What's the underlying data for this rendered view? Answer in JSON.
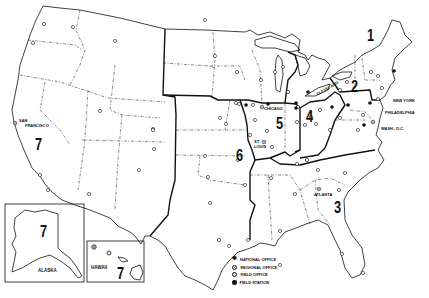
{
  "header": {
    "text": "· · ·  ·  · ·"
  },
  "map": {
    "title": "Regional map of the United States",
    "regions": [
      {
        "number": "1",
        "x": 366,
        "y": 36
      },
      {
        "number": "2",
        "x": 353,
        "y": 86
      },
      {
        "number": "3",
        "x": 333,
        "y": 208
      },
      {
        "number": "4",
        "x": 307,
        "y": 105
      },
      {
        "number": "5",
        "x": 275,
        "y": 100
      },
      {
        "number": "6",
        "x": 248,
        "y": 158
      },
      {
        "number": "7",
        "x": 36,
        "y": 168
      }
    ],
    "cities": [
      {
        "name": "NEW YORK",
        "x": 369,
        "y": 100
      },
      {
        "name": "PHILADELPHIA",
        "x": 371,
        "y": 111
      },
      {
        "name": "WASH., D.C.",
        "x": 382,
        "y": 127
      },
      {
        "name": "CLEVELAND",
        "x": 320,
        "y": 94
      },
      {
        "name": "CHICAGO",
        "x": 262,
        "y": 107
      },
      {
        "name": "ST.",
        "x": 254,
        "y": 141
      },
      {
        "name": "LOUIS",
        "x": 254,
        "y": 145
      },
      {
        "name": "ATLANTA",
        "x": 315,
        "y": 194
      },
      {
        "name": "SAN",
        "x": 20,
        "y": 121
      },
      {
        "name": "FRANCISCO",
        "x": 25,
        "y": 125
      }
    ],
    "insets": {
      "alaska": {
        "label": "ALASKA",
        "region": "7"
      },
      "hawaii": {
        "label": "HAWAII",
        "region": "7"
      }
    }
  },
  "legend": {
    "items": [
      {
        "symbol": "national",
        "label": "NATIONAL OFFICE"
      },
      {
        "symbol": "regional",
        "label": "REGIONAL OFFICE"
      },
      {
        "symbol": "field",
        "label": "FIELD OFFICE"
      },
      {
        "symbol": "station",
        "label": "FIELD STATION"
      }
    ]
  },
  "colors": {
    "ink": "#111111",
    "background": "#ffffff"
  }
}
